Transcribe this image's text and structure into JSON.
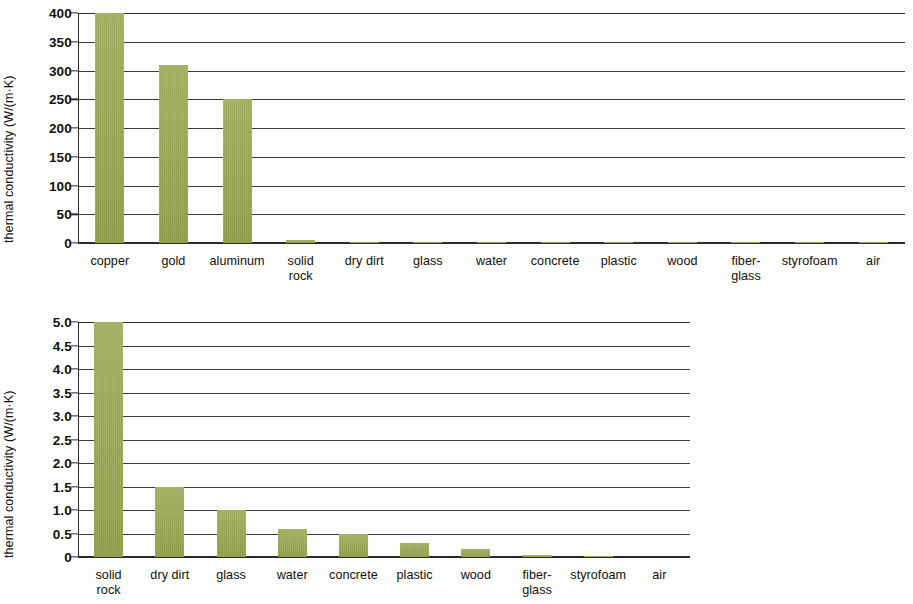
{
  "figure": {
    "bar_color": "#9aa84f",
    "axis_color": "#2b2b2b",
    "background": "#fdfdfb"
  },
  "chart_data": [
    {
      "id": "top",
      "type": "bar",
      "title": "",
      "xlabel": "",
      "ylabel": "thermal conductivity (W/(m·K)",
      "ylim": [
        0,
        400
      ],
      "yticks": [
        "0",
        "50",
        "100",
        "150",
        "200",
        "250",
        "300",
        "350",
        "400"
      ],
      "ytick_values": [
        0,
        50,
        100,
        150,
        200,
        250,
        300,
        350,
        400
      ],
      "grid": true,
      "legend": "none",
      "categories": [
        "copper",
        "gold",
        "aluminum",
        "solid\nrock",
        "dry dirt",
        "glass",
        "water",
        "concrete",
        "plastic",
        "wood",
        "fiber-\nglass",
        "styrofoam",
        "air"
      ],
      "values": [
        400,
        310,
        250,
        5,
        1.5,
        1.0,
        0.6,
        0.5,
        0.3,
        0.17,
        0.04,
        0.03,
        0.025
      ],
      "notes": "copper bar is clipped at the 400 axis maximum"
    },
    {
      "id": "bottom",
      "type": "bar",
      "title": "",
      "xlabel": "",
      "ylabel": "thermal conductivity (W/(m·K)",
      "ylim": [
        0,
        5
      ],
      "yticks": [
        "0",
        "0.5",
        "1.0",
        "1.5",
        "2.0",
        "2.5",
        "3.0",
        "3.5",
        "4.0",
        "4.5",
        "5.0"
      ],
      "ytick_values": [
        0,
        0.5,
        1.0,
        1.5,
        2.0,
        2.5,
        3.0,
        3.5,
        4.0,
        4.5,
        5.0
      ],
      "grid": true,
      "legend": "none",
      "categories": [
        "solid\nrock",
        "dry dirt",
        "glass",
        "water",
        "concrete",
        "plastic",
        "wood",
        "fiber-\nglass",
        "styrofoam",
        "air"
      ],
      "values": [
        5.0,
        1.5,
        1.0,
        0.6,
        0.5,
        0.3,
        0.17,
        0.04,
        0.03,
        0.0
      ],
      "notes": "solid rock bar is clipped at the 5.0 axis maximum"
    }
  ]
}
